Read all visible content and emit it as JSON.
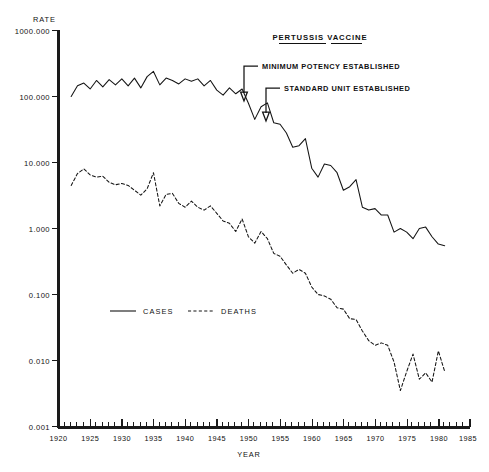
{
  "chart_data": {
    "type": "line",
    "title": "",
    "xlabel": "YEAR",
    "ylabel": "RATE",
    "yscale": "log",
    "ylim": [
      0.001,
      1000.0
    ],
    "xlim": [
      1920,
      1985
    ],
    "grid": false,
    "legend_position": "inside-lower-left",
    "ytick_labels": [
      "1000.000",
      "100.000",
      "10.000",
      "1.000",
      "0.100",
      "0.010",
      "0.001"
    ],
    "ytick_values": [
      1000.0,
      100.0,
      10.0,
      1.0,
      0.1,
      0.01,
      0.001
    ],
    "xtick_labels": [
      "1920",
      "1925",
      "1930",
      "1935",
      "1940",
      "1945",
      "1950",
      "1955",
      "1960",
      "1965",
      "1970",
      "1975",
      "1980",
      "1985"
    ],
    "xtick_values": [
      1920,
      1925,
      1930,
      1935,
      1940,
      1945,
      1950,
      1955,
      1960,
      1965,
      1970,
      1975,
      1980,
      1985
    ],
    "x_minor_tick_interval": 1,
    "series": [
      {
        "name": "CASES",
        "style": "solid",
        "x": [
          1922,
          1923,
          1924,
          1925,
          1926,
          1927,
          1928,
          1929,
          1930,
          1931,
          1932,
          1933,
          1934,
          1935,
          1936,
          1937,
          1938,
          1939,
          1940,
          1941,
          1942,
          1943,
          1944,
          1945,
          1946,
          1947,
          1948,
          1949,
          1950,
          1951,
          1952,
          1953,
          1954,
          1955,
          1956,
          1957,
          1958,
          1959,
          1960,
          1961,
          1962,
          1963,
          1964,
          1965,
          1966,
          1967,
          1968,
          1969,
          1970,
          1971,
          1972,
          1973,
          1974,
          1975,
          1976,
          1977,
          1978,
          1979,
          1980,
          1981
        ],
        "y": [
          100.0,
          145.0,
          160.0,
          130.0,
          175.0,
          140.0,
          180.0,
          150.0,
          185.0,
          145.0,
          190.0,
          135.0,
          200.0,
          240.0,
          150.0,
          190.0,
          175.0,
          155.0,
          185.0,
          170.0,
          185.0,
          145.0,
          175.0,
          125.0,
          105.0,
          135.0,
          110.0,
          130.0,
          79.0,
          45.0,
          70.0,
          80.0,
          40.0,
          38.0,
          28.0,
          17.0,
          18.0,
          23.0,
          8.2,
          6.0,
          9.5,
          9.0,
          7.0,
          3.8,
          4.3,
          5.5,
          2.1,
          1.9,
          2.0,
          1.6,
          1.6,
          0.88,
          1.0,
          0.88,
          0.7,
          1.0,
          1.05,
          0.75,
          0.58,
          0.55
        ]
      },
      {
        "name": "DEATHS",
        "style": "dashed",
        "x": [
          1922,
          1923,
          1924,
          1925,
          1926,
          1927,
          1928,
          1929,
          1930,
          1931,
          1932,
          1933,
          1934,
          1935,
          1936,
          1937,
          1938,
          1939,
          1940,
          1941,
          1942,
          1943,
          1944,
          1945,
          1946,
          1947,
          1948,
          1949,
          1950,
          1951,
          1952,
          1953,
          1954,
          1955,
          1956,
          1957,
          1958,
          1959,
          1960,
          1961,
          1962,
          1963,
          1964,
          1965,
          1966,
          1967,
          1968,
          1969,
          1970,
          1971,
          1972,
          1973,
          1974,
          1975,
          1976,
          1977,
          1978,
          1979,
          1980,
          1981
        ],
        "y": [
          4.5,
          6.8,
          8.0,
          6.5,
          6.0,
          6.2,
          5.0,
          4.6,
          4.8,
          4.5,
          3.8,
          3.2,
          4.0,
          7.0,
          2.2,
          3.3,
          3.4,
          2.4,
          2.1,
          2.6,
          2.1,
          1.9,
          2.2,
          1.7,
          1.3,
          1.2,
          0.9,
          1.4,
          0.75,
          0.6,
          0.9,
          0.7,
          0.42,
          0.38,
          0.28,
          0.21,
          0.24,
          0.21,
          0.13,
          0.1,
          0.095,
          0.085,
          0.063,
          0.06,
          0.043,
          0.042,
          0.028,
          0.02,
          0.017,
          0.0185,
          0.017,
          0.0095,
          0.0035,
          0.0068,
          0.0125,
          0.0052,
          0.0065,
          0.0047,
          0.014,
          0.0068
        ]
      }
    ],
    "annotations": [
      {
        "id": "pertussis-vaccine-title",
        "text": "PERTUSSIS VACCINE",
        "underlined": true,
        "x": 1955.5,
        "y_px": 38
      },
      {
        "id": "minimum-potency-established",
        "text": "MINIMUM POTENCY ESTABLISHED",
        "arrow_target_year": 1951,
        "arrow_target_value": 45.0
      },
      {
        "id": "standard-unit-established",
        "text": "STANDARD UNIT ESTABLISHED",
        "arrow_target_year": 1954.7,
        "arrow_target_value": 28.0
      }
    ],
    "legend": [
      {
        "label": "CASES",
        "style": "solid"
      },
      {
        "label": "DEATHS",
        "style": "dashed"
      }
    ]
  }
}
